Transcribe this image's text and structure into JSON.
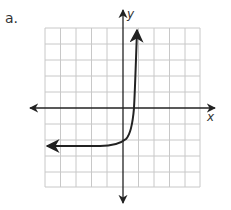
{
  "part_label": "a.",
  "axes": {
    "x_label": "x",
    "y_label": "y"
  },
  "grid": {
    "columns": 10,
    "rows": 10,
    "line_color": "#c8c8c8",
    "axis_color": "#222222"
  },
  "curve": {
    "description": "exponential growth curve with horizontal asymptote below x-axis",
    "color": "#222222"
  }
}
